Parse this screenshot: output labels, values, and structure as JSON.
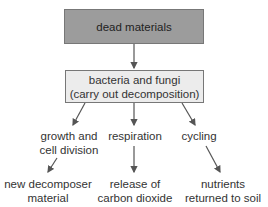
{
  "top_box": {
    "label": "dead materials",
    "fill": "#9c9c9c"
  },
  "mid_box": {
    "line1": "bacteria and fungi",
    "line2": "(carry out decomposition)",
    "fill": "#ececec"
  },
  "branches": [
    {
      "process_line1": "growth and",
      "process_line2": "cell division",
      "result_line1": "new decomposer",
      "result_line2": "material"
    },
    {
      "process_line1": "respiration",
      "process_line2": "",
      "result_line1": "release of",
      "result_line2": "carbon dioxide"
    },
    {
      "process_line1": "cycling",
      "process_line2": "",
      "result_line1": "nutrients",
      "result_line2": "returned to soil"
    }
  ],
  "colors": {
    "arrow": "#555555",
    "border": "#777777"
  }
}
